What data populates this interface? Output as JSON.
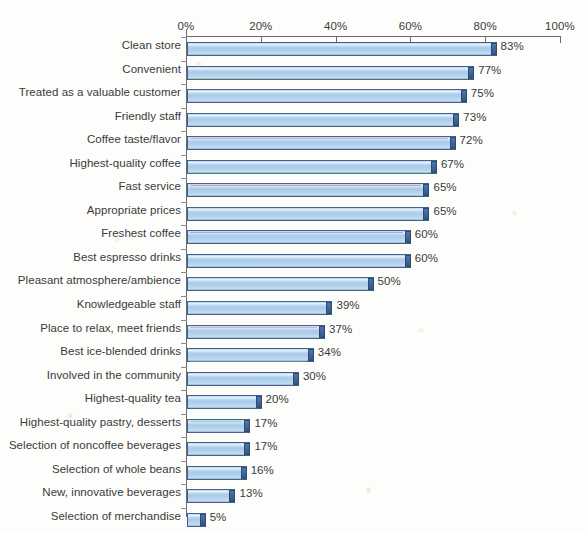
{
  "chart_data": {
    "type": "bar",
    "orientation": "horizontal",
    "title": "",
    "xlabel": "",
    "ylabel": "",
    "xlim": [
      0,
      100
    ],
    "xticks": [
      "0%",
      "20%",
      "40%",
      "60%",
      "80%",
      "100%"
    ],
    "xtick_values": [
      0,
      20,
      40,
      60,
      80,
      100
    ],
    "grid": false,
    "legend": null,
    "value_suffix": "%",
    "categories": [
      "Clean store",
      "Convenient",
      "Treated as a valuable customer",
      "Friendly staff",
      "Coffee taste/flavor",
      "Highest-quality coffee",
      "Fast service",
      "Appropriate prices",
      "Freshest coffee",
      "Best espresso drinks",
      "Pleasant atmosphere/ambience",
      "Knowledgeable staff",
      "Place to relax, meet friends",
      "Best ice-blended drinks",
      "Involved in the community",
      "Highest-quality tea",
      "Highest-quality pastry, desserts",
      "Selection of noncoffee beverages",
      "Selection of whole beans",
      "New, innovative beverages",
      "Selection of merchandise"
    ],
    "values": [
      83,
      77,
      75,
      73,
      72,
      67,
      65,
      65,
      60,
      60,
      50,
      39,
      37,
      34,
      30,
      20,
      17,
      17,
      16,
      13,
      5
    ],
    "data_labels": [
      "83%",
      "77%",
      "75%",
      "73%",
      "72%",
      "67%",
      "65%",
      "65%",
      "60%",
      "60%",
      "50%",
      "39%",
      "37%",
      "34%",
      "30%",
      "20%",
      "17%",
      "17%",
      "16%",
      "13%",
      "5%"
    ],
    "colors": {
      "bar_fill": "#a9cbe9",
      "bar_fill_light": "#c9dff2",
      "bar_border": "#41618f",
      "bar_cap": "#3f6499",
      "axis": "#6b6b6b",
      "text": "#3a3a3a",
      "background": "#fdfdfb"
    }
  }
}
